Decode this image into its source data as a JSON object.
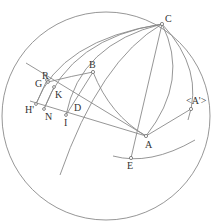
{
  "diagram": {
    "type": "celestial-sphere-geometric-construction",
    "colors": {
      "line": "#8a8a8a",
      "point": "#6a6a6a",
      "label": "#333333",
      "background": "#ffffff"
    },
    "circle": {
      "cx": 106,
      "cy": 116,
      "r": 104
    },
    "points": [
      {
        "id": "C",
        "label": "C",
        "x": 162,
        "y": 24,
        "lx": 165,
        "ly": 22
      },
      {
        "id": "B",
        "label": "B",
        "x": 93,
        "y": 72,
        "lx": 89,
        "ly": 67
      },
      {
        "id": "R",
        "label": "R",
        "x": 47,
        "y": 80,
        "lx": 43,
        "ly": 78
      },
      {
        "id": "G",
        "label": "G",
        "x": 48,
        "y": 82,
        "lx": 36,
        "ly": 87
      },
      {
        "id": "K",
        "label": "K",
        "x": 54,
        "y": 87,
        "lx": 54,
        "ly": 98
      },
      {
        "id": "D",
        "label": "D",
        "x": 76,
        "y": 99,
        "lx": 74,
        "ly": 111
      },
      {
        "id": "H",
        "label": "H'",
        "x": 36,
        "y": 104,
        "lx": 26,
        "ly": 113
      },
      {
        "id": "N",
        "label": "N",
        "x": 44,
        "y": 109,
        "lx": 45,
        "ly": 120
      },
      {
        "id": "I",
        "label": "I",
        "x": 66,
        "y": 115,
        "lx": 64,
        "ly": 126
      },
      {
        "id": "A",
        "label": "A",
        "x": 146,
        "y": 136,
        "lx": 145,
        "ly": 148
      },
      {
        "id": "E",
        "label": "E",
        "x": 131,
        "y": 158,
        "lx": 127,
        "ly": 169
      },
      {
        "id": "Aprime",
        "label": "<A'>",
        "x": 191,
        "y": 109,
        "lx": 187,
        "ly": 104
      }
    ],
    "labels": {
      "C": "C",
      "B": "B",
      "R": "R",
      "G": "G",
      "K": "K",
      "D": "D",
      "H": "H'",
      "N": "N",
      "I": "I",
      "A": "A",
      "E": "E",
      "Aprime": "<A'>"
    }
  }
}
